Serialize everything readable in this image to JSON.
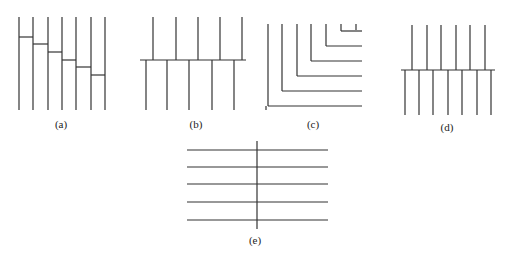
{
  "figure": {
    "panels": [
      {
        "id": "a",
        "label": "(a)",
        "description": "seven vertical lines connected by descending staircase steps"
      },
      {
        "id": "b",
        "label": "(b)",
        "description": "five upper vertical lines and five offset lower vertical lines meeting a common horizontal line"
      },
      {
        "id": "c",
        "label": "(c)",
        "description": "nested L-shaped lines: seven verticals each turning right into horizontals"
      },
      {
        "id": "d",
        "label": "(d)",
        "description": "six upper vertical lines and seven offset lower vertical lines meeting a common horizontal line"
      },
      {
        "id": "e",
        "label": "(e)",
        "description": "five horizontal lines crossed by a single vertical line"
      }
    ],
    "colors": {
      "line": "#333333",
      "background": "#ffffff"
    }
  }
}
